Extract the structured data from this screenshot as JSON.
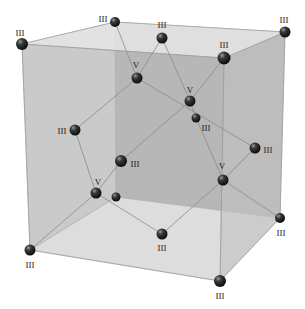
{
  "diagram": {
    "type": "crystal-unit-cell",
    "colors": {
      "back_face": "#a9a9a9",
      "left_face": "#bdbdbd",
      "right_face": "#c4c4c4",
      "top_face": "#e4e4e4",
      "bottom_face": "#e0e0e0",
      "front_face": "#d2d2d2",
      "edge": "#999999",
      "bond": "#8a8a8a",
      "atom": "#222222"
    },
    "corners": {
      "front_top_left": [
        22,
        44
      ],
      "front_top_right": [
        224,
        58
      ],
      "front_bottom_right": [
        220,
        281
      ],
      "front_bottom_left": [
        30,
        250
      ],
      "back_top_left": [
        115,
        22
      ],
      "back_top_right": [
        285,
        32
      ],
      "back_bottom_right": [
        280,
        218
      ],
      "back_bottom_left": [
        116,
        197
      ]
    },
    "atoms": [
      {
        "id": "a1",
        "x": 22,
        "y": 44,
        "r": 6,
        "label": "III",
        "lx": 20,
        "ly": 34
      },
      {
        "id": "a2",
        "x": 115,
        "y": 22,
        "r": 5,
        "label": "III",
        "lx": 103,
        "ly": 20
      },
      {
        "id": "a3",
        "x": 162,
        "y": 38,
        "r": 5.5,
        "label": "III",
        "lx": 162,
        "ly": 26
      },
      {
        "id": "a4",
        "x": 285,
        "y": 32,
        "r": 5.5,
        "label": "III",
        "lx": 284,
        "ly": 21
      },
      {
        "id": "a5",
        "x": 224,
        "y": 58,
        "r": 6.5,
        "label": "III",
        "lx": 224,
        "ly": 46
      },
      {
        "id": "a6",
        "x": 137,
        "y": 78,
        "r": 5.5,
        "label": "V",
        "lx": 136,
        "ly": 66
      },
      {
        "id": "a7",
        "x": 190,
        "y": 101,
        "r": 5.5,
        "label": "V",
        "lx": 190,
        "ly": 91
      },
      {
        "id": "a8",
        "x": 196,
        "y": 118,
        "r": 4.5,
        "label": "III",
        "lx": 206,
        "ly": 129
      },
      {
        "id": "a9",
        "x": 75,
        "y": 130,
        "r": 5.5,
        "label": "III",
        "lx": 62,
        "ly": 132
      },
      {
        "id": "a10",
        "x": 255,
        "y": 148,
        "r": 5.5,
        "label": "III",
        "lx": 268,
        "ly": 151
      },
      {
        "id": "a11",
        "x": 121,
        "y": 161,
        "r": 6,
        "label": "III",
        "lx": 135,
        "ly": 165
      },
      {
        "id": "a12",
        "x": 96,
        "y": 193,
        "r": 5.5,
        "label": "V",
        "lx": 98,
        "ly": 183
      },
      {
        "id": "a13",
        "x": 116,
        "y": 197,
        "r": 4.5,
        "label": "",
        "lx": 0,
        "ly": 0
      },
      {
        "id": "a14",
        "x": 223,
        "y": 180,
        "r": 5.5,
        "label": "V",
        "lx": 222,
        "ly": 167
      },
      {
        "id": "a15",
        "x": 280,
        "y": 218,
        "r": 5,
        "label": "III",
        "lx": 281,
        "ly": 234
      },
      {
        "id": "a16",
        "x": 162,
        "y": 234,
        "r": 5.5,
        "label": "III",
        "lx": 162,
        "ly": 249
      },
      {
        "id": "a17",
        "x": 30,
        "y": 250,
        "r": 5.5,
        "label": "III",
        "lx": 30,
        "ly": 266
      },
      {
        "id": "a18",
        "x": 220,
        "y": 281,
        "r": 6,
        "label": "III",
        "lx": 220,
        "ly": 297
      }
    ],
    "bonds": [
      [
        "a6",
        "a2"
      ],
      [
        "a6",
        "a3"
      ],
      [
        "a6",
        "a9"
      ],
      [
        "a6",
        "a10"
      ],
      [
        "a7",
        "a3"
      ],
      [
        "a7",
        "a5"
      ],
      [
        "a7",
        "a8"
      ],
      [
        "a7",
        "a11"
      ],
      [
        "a12",
        "a9"
      ],
      [
        "a12",
        "a11"
      ],
      [
        "a12",
        "a17"
      ],
      [
        "a12",
        "a16"
      ],
      [
        "a14",
        "a8"
      ],
      [
        "a14",
        "a10"
      ],
      [
        "a14",
        "a15"
      ],
      [
        "a14",
        "a16"
      ]
    ]
  }
}
